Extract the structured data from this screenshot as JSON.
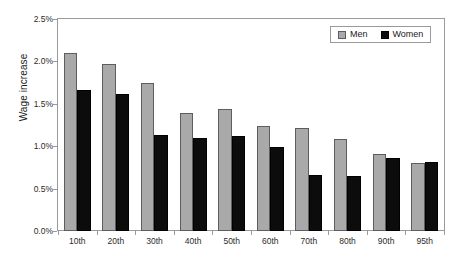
{
  "chart_data": {
    "type": "bar",
    "title": "",
    "xlabel": "",
    "ylabel": "Wage increase",
    "categories": [
      "10th",
      "20th",
      "30th",
      "40th",
      "50th",
      "60th",
      "70th",
      "80th",
      "90th",
      "95th"
    ],
    "series": [
      {
        "name": "Men",
        "color": "#a9a9a9",
        "values": [
          2.1,
          1.97,
          1.75,
          1.39,
          1.44,
          1.24,
          1.22,
          1.09,
          0.91,
          0.8
        ]
      },
      {
        "name": "Women",
        "color": "#0c0c0c",
        "values": [
          1.66,
          1.61,
          1.13,
          1.1,
          1.12,
          0.99,
          0.66,
          0.65,
          0.86,
          0.81
        ]
      }
    ],
    "ylim": [
      0,
      2.5
    ],
    "ytick_values": [
      0.0,
      0.5,
      1.0,
      1.5,
      2.0,
      2.5
    ],
    "ytick_labels": [
      "0.0%",
      "0.5%",
      "1.0%",
      "1.5%",
      "2.0%",
      "2.5%"
    ],
    "grid": false,
    "legend_position": "top-right",
    "value_suffix": "%"
  },
  "legend": {
    "entries": [
      {
        "label": "Men",
        "swatch": "men"
      },
      {
        "label": "Women",
        "swatch": "women"
      }
    ]
  }
}
